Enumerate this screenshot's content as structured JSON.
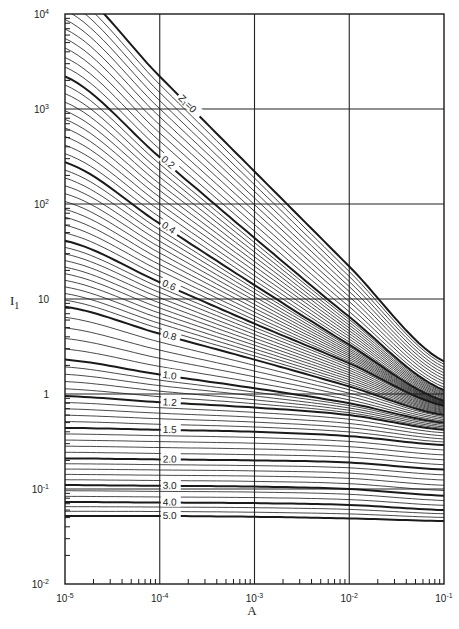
{
  "chart_data": {
    "type": "line",
    "title": "",
    "xlabel": "A",
    "ylabel": "I1",
    "xscale": "log",
    "yscale": "log",
    "xlim": [
      1e-05,
      0.1
    ],
    "ylim": [
      0.01,
      10000
    ],
    "grid": true,
    "x_ticks": [
      {
        "value": 1e-05,
        "base": "10",
        "exp": "-5"
      },
      {
        "value": 0.0001,
        "base": "10",
        "exp": "-4"
      },
      {
        "value": 0.001,
        "base": "10",
        "exp": "-3"
      },
      {
        "value": 0.01,
        "base": "10",
        "exp": "-2"
      },
      {
        "value": 0.1,
        "base": "10",
        "exp": "-1"
      }
    ],
    "y_ticks": [
      {
        "value": 10000,
        "base": "10",
        "exp": "4"
      },
      {
        "value": 1000,
        "base": "10",
        "exp": "3"
      },
      {
        "value": 100,
        "base": "10",
        "exp": "2"
      },
      {
        "value": 10,
        "base": "10",
        "exp": ""
      },
      {
        "value": 1,
        "base": "1",
        "exp": ""
      },
      {
        "value": 0.1,
        "base": "10",
        "exp": "-1"
      },
      {
        "value": 0.01,
        "base": "10",
        "exp": "-2"
      }
    ],
    "x_sample_points": [
      1e-05,
      0.0001,
      0.001,
      0.01,
      0.1
    ],
    "series": [
      {
        "name": "Z1=0",
        "label": "Z₁=0",
        "values": [
          22000,
          2200,
          220,
          22,
          2.2
        ]
      },
      {
        "name": "Z1=0.2",
        "label": "0.2",
        "values": [
          2200,
          310,
          44,
          6.5,
          1.1
        ]
      },
      {
        "name": "Z1=0.4",
        "label": "0.4",
        "values": [
          275,
          62,
          14,
          3.3,
          0.85
        ]
      },
      {
        "name": "Z1=0.6",
        "label": "0.6",
        "values": [
          41,
          15,
          5.5,
          2.1,
          0.75
        ]
      },
      {
        "name": "Z1=0.8",
        "label": "0.8",
        "values": [
          8.3,
          4.3,
          2.3,
          1.2,
          0.6
        ]
      },
      {
        "name": "Z1=1.0",
        "label": "1.0",
        "values": [
          2.3,
          1.6,
          1.15,
          0.8,
          0.5
        ]
      },
      {
        "name": "Z1=1.2",
        "label": "1.2",
        "values": [
          0.95,
          0.82,
          0.72,
          0.6,
          0.42
        ]
      },
      {
        "name": "Z1=1.5",
        "label": "1.5",
        "values": [
          0.44,
          0.42,
          0.4,
          0.36,
          0.29
        ]
      },
      {
        "name": "Z1=2.0",
        "label": "2.0",
        "values": [
          0.21,
          0.205,
          0.2,
          0.19,
          0.16
        ]
      },
      {
        "name": "Z1=3.0",
        "label": "3.0",
        "values": [
          0.11,
          0.108,
          0.106,
          0.1,
          0.085
        ]
      },
      {
        "name": "Z1=4.0",
        "label": "4.0",
        "values": [
          0.073,
          0.072,
          0.071,
          0.068,
          0.06
        ]
      },
      {
        "name": "Z1=5.0",
        "label": "5.0",
        "values": [
          0.052,
          0.052,
          0.051,
          0.049,
          0.046
        ]
      }
    ],
    "intermediate_curves_per_interval": [
      9,
      9,
      9,
      9,
      4,
      4,
      4,
      4,
      4,
      2,
      2
    ],
    "label_anchor_x": [
      0.00016,
      0.0001,
      0.0001,
      0.0001,
      0.0001,
      0.0001,
      0.0001,
      0.0001,
      0.0001,
      0.0001,
      0.0001,
      0.0001
    ],
    "colors": {
      "line": "#1a1a1a",
      "grid": "#222222",
      "background": "#ffffff"
    }
  }
}
